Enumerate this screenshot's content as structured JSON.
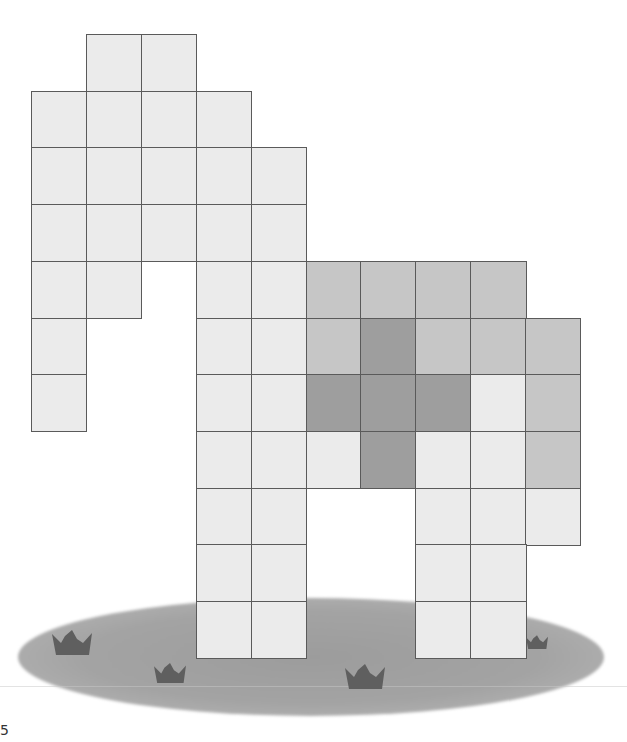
{
  "figure": {
    "grid": {
      "origin_x": 31,
      "origin_y": 34,
      "cell_w": 54.9,
      "cell_h": 56.7,
      "cols": 11,
      "rows": 11
    },
    "colors": {
      "light": "#ebebeb",
      "mid": "#c6c6c6",
      "dark": "#9e9e9e",
      "border": "#5a5a5a",
      "ground": "#a3a3a3",
      "tuft": "#5f5f5f"
    },
    "cells": [
      {
        "r": 0,
        "c": 1,
        "t": "light"
      },
      {
        "r": 0,
        "c": 2,
        "t": "light"
      },
      {
        "r": 1,
        "c": 0,
        "t": "light"
      },
      {
        "r": 1,
        "c": 1,
        "t": "light"
      },
      {
        "r": 1,
        "c": 2,
        "t": "light"
      },
      {
        "r": 1,
        "c": 3,
        "t": "light"
      },
      {
        "r": 2,
        "c": 0,
        "t": "light"
      },
      {
        "r": 2,
        "c": 1,
        "t": "light"
      },
      {
        "r": 2,
        "c": 2,
        "t": "light"
      },
      {
        "r": 2,
        "c": 3,
        "t": "light"
      },
      {
        "r": 2,
        "c": 4,
        "t": "light"
      },
      {
        "r": 3,
        "c": 0,
        "t": "light"
      },
      {
        "r": 3,
        "c": 1,
        "t": "light"
      },
      {
        "r": 3,
        "c": 2,
        "t": "light"
      },
      {
        "r": 3,
        "c": 3,
        "t": "light"
      },
      {
        "r": 3,
        "c": 4,
        "t": "light"
      },
      {
        "r": 4,
        "c": 0,
        "t": "light"
      },
      {
        "r": 4,
        "c": 1,
        "t": "light"
      },
      {
        "r": 4,
        "c": 3,
        "t": "light"
      },
      {
        "r": 4,
        "c": 4,
        "t": "light"
      },
      {
        "r": 4,
        "c": 5,
        "t": "mid"
      },
      {
        "r": 4,
        "c": 6,
        "t": "mid"
      },
      {
        "r": 4,
        "c": 7,
        "t": "mid"
      },
      {
        "r": 4,
        "c": 8,
        "t": "mid"
      },
      {
        "r": 5,
        "c": 0,
        "t": "light"
      },
      {
        "r": 5,
        "c": 3,
        "t": "light"
      },
      {
        "r": 5,
        "c": 4,
        "t": "light"
      },
      {
        "r": 5,
        "c": 5,
        "t": "mid"
      },
      {
        "r": 5,
        "c": 6,
        "t": "dark"
      },
      {
        "r": 5,
        "c": 7,
        "t": "mid"
      },
      {
        "r": 5,
        "c": 8,
        "t": "mid"
      },
      {
        "r": 5,
        "c": 9,
        "t": "mid"
      },
      {
        "r": 6,
        "c": 0,
        "t": "light"
      },
      {
        "r": 6,
        "c": 3,
        "t": "light"
      },
      {
        "r": 6,
        "c": 4,
        "t": "light"
      },
      {
        "r": 6,
        "c": 5,
        "t": "dark"
      },
      {
        "r": 6,
        "c": 6,
        "t": "dark"
      },
      {
        "r": 6,
        "c": 7,
        "t": "dark"
      },
      {
        "r": 6,
        "c": 8,
        "t": "light"
      },
      {
        "r": 6,
        "c": 9,
        "t": "mid"
      },
      {
        "r": 7,
        "c": 3,
        "t": "light"
      },
      {
        "r": 7,
        "c": 4,
        "t": "light"
      },
      {
        "r": 7,
        "c": 5,
        "t": "light"
      },
      {
        "r": 7,
        "c": 6,
        "t": "dark"
      },
      {
        "r": 7,
        "c": 7,
        "t": "light"
      },
      {
        "r": 7,
        "c": 8,
        "t": "light"
      },
      {
        "r": 7,
        "c": 9,
        "t": "mid"
      },
      {
        "r": 8,
        "c": 3,
        "t": "light"
      },
      {
        "r": 8,
        "c": 4,
        "t": "light"
      },
      {
        "r": 8,
        "c": 7,
        "t": "light"
      },
      {
        "r": 8,
        "c": 8,
        "t": "light"
      },
      {
        "r": 8,
        "c": 9,
        "t": "light"
      },
      {
        "r": 9,
        "c": 3,
        "t": "light"
      },
      {
        "r": 9,
        "c": 4,
        "t": "light"
      },
      {
        "r": 9,
        "c": 7,
        "t": "light"
      },
      {
        "r": 9,
        "c": 8,
        "t": "light"
      },
      {
        "r": 10,
        "c": 3,
        "t": "light"
      },
      {
        "r": 10,
        "c": 4,
        "t": "light"
      },
      {
        "r": 10,
        "c": 7,
        "t": "light"
      },
      {
        "r": 10,
        "c": 8,
        "t": "light"
      }
    ],
    "tufts": [
      {
        "x": 52,
        "y": 630,
        "w": 40,
        "h": 25
      },
      {
        "x": 154,
        "y": 663,
        "w": 32,
        "h": 20
      },
      {
        "x": 345,
        "y": 664,
        "w": 40,
        "h": 25
      },
      {
        "x": 526,
        "y": 630,
        "w": 22,
        "h": 24
      }
    ],
    "counts": {
      "light": 44,
      "mid": 10,
      "dark": 5,
      "total": 59
    },
    "corner_mark": "5"
  }
}
